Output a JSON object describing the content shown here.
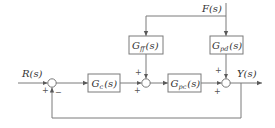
{
  "diagram": {
    "type": "feedforward-feedback control block diagram",
    "signals": {
      "input": "R(s)",
      "disturbance": "F(s)",
      "output": "Y(s)"
    },
    "blocks": [
      {
        "id": "Gc",
        "label_main": "G",
        "label_sub": "c",
        "label_arg": "(s)"
      },
      {
        "id": "Gff",
        "label_main": "G",
        "label_sub": "ff",
        "label_arg": "(s)"
      },
      {
        "id": "Gpc",
        "label_main": "G",
        "label_sub": "pc",
        "label_arg": "(s)"
      },
      {
        "id": "Gpd",
        "label_main": "G",
        "label_sub": "pd",
        "label_arg": "(s)"
      }
    ],
    "summing_junctions": [
      {
        "id": "sum1",
        "signs": {
          "left": "+",
          "bottom": "−"
        }
      },
      {
        "id": "sum2",
        "signs": {
          "top": "+",
          "left": "+"
        }
      },
      {
        "id": "sum3",
        "signs": {
          "top": "+",
          "left": "+"
        }
      }
    ],
    "colors": {
      "line": "#7a7a7a",
      "text": "#333333"
    }
  }
}
